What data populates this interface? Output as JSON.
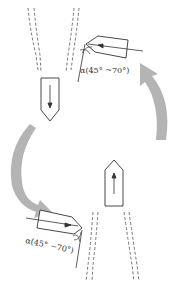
{
  "diagram": {
    "labels": {
      "angle_top": "α(45° ~70°)",
      "angle_bottom": "α(45° ~70°)"
    },
    "elements": [
      {
        "id": "upper-channel",
        "type": "dashed-channel",
        "position": "top-left"
      },
      {
        "id": "lower-channel",
        "type": "dashed-channel",
        "position": "bottom-right"
      },
      {
        "id": "tool-down",
        "type": "pentagon-tool",
        "direction": "down"
      },
      {
        "id": "tool-up",
        "type": "pentagon-tool",
        "direction": "up"
      },
      {
        "id": "tool-left-top",
        "type": "angled-tool",
        "direction": "left"
      },
      {
        "id": "tool-right-bottom",
        "type": "angled-tool",
        "direction": "right"
      },
      {
        "id": "curved-arrow-right",
        "type": "gray-arrow",
        "direction": "up"
      },
      {
        "id": "curved-arrow-left",
        "type": "gray-arrow",
        "direction": "down-right"
      }
    ],
    "colors": {
      "line": "#333333",
      "arrow_fill": "#b4b4b4",
      "background": "#ffffff"
    }
  }
}
